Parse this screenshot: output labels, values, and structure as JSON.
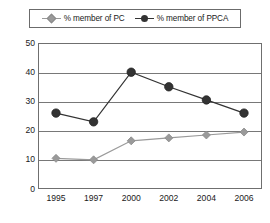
{
  "chart_data": {
    "type": "line",
    "title": "",
    "xlabel": "",
    "ylabel": "",
    "categories": [
      "1995",
      "1997",
      "2000",
      "2002",
      "2004",
      "2006"
    ],
    "ylim": [
      0,
      50
    ],
    "yticks": [
      "0",
      "10",
      "20",
      "30",
      "40",
      "50"
    ],
    "grid": true,
    "legend_position": "top",
    "series": [
      {
        "name": "% member of PC",
        "marker": "diamond",
        "color": "#9a9a9a",
        "values": [
          10.5,
          10,
          16.5,
          17.5,
          18.5,
          19.5
        ]
      },
      {
        "name": "% member of PPCA",
        "marker": "circle",
        "color": "#333333",
        "values": [
          26,
          23,
          40,
          35,
          30.5,
          26
        ]
      }
    ]
  },
  "legend": {
    "items": [
      {
        "label": "% member of PC",
        "icon": "diamond-marker"
      },
      {
        "label": "% member of PPCA",
        "icon": "circle-marker"
      }
    ]
  }
}
